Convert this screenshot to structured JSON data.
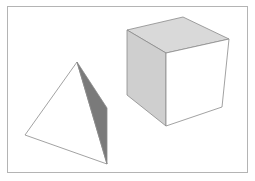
{
  "diagram": {
    "shapes": [
      {
        "name": "tetrahedron",
        "faces": [
          {
            "name": "front-face",
            "points": "77,62 25,135 107,164",
            "fill": "#ffffff"
          },
          {
            "name": "side-face",
            "points": "77,62 107,108 107,164",
            "fill": "#7a7a7a"
          }
        ]
      },
      {
        "name": "cube",
        "faces": [
          {
            "name": "top-face",
            "points": "127,30 183,17 229,39 166,53",
            "fill": "#d9d9d9"
          },
          {
            "name": "left-face",
            "points": "127,30 166,53 166,126 127,95",
            "fill": "#cfcfcf"
          },
          {
            "name": "front-face",
            "points": "166,53 229,39 222,107 166,126",
            "fill": "#ffffff"
          }
        ]
      }
    ],
    "colors": {
      "frame": "#b4b4b4",
      "edge": "#8a8a8a",
      "background": "#ffffff"
    }
  }
}
